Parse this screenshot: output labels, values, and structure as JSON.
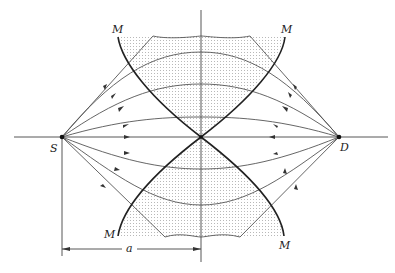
{
  "figure": {
    "labels": {
      "source": "S",
      "detector": "D",
      "mirror_top_left": "M",
      "mirror_top_right": "M",
      "mirror_bottom_left": "M",
      "mirror_bottom_right": "M",
      "distance": "a"
    },
    "colors": {
      "line": "#555555",
      "mirror": "#222222",
      "shading_dot": "#bbbbbb",
      "background": "#ffffff"
    }
  }
}
